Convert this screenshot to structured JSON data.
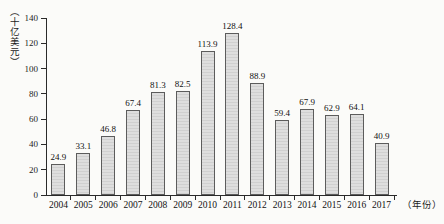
{
  "chart_data": {
    "type": "bar",
    "categories": [
      "2004",
      "2005",
      "2006",
      "2007",
      "2008",
      "2009",
      "2010",
      "2011",
      "2012",
      "2013",
      "2014",
      "2015",
      "2016",
      "2017"
    ],
    "values": [
      24.9,
      33.1,
      46.8,
      67.4,
      81.3,
      82.5,
      113.9,
      128.4,
      88.9,
      59.4,
      67.9,
      62.9,
      64.1,
      40.9
    ],
    "value_labels": [
      "24.9",
      "33.1",
      "46.8",
      "67.4",
      "81.3",
      "82.5",
      "113.9",
      "128.4",
      "88.9",
      "59.4",
      "67.9",
      "62.9",
      "64.1",
      "40.9"
    ],
    "title": "",
    "xlabel": "（年份）",
    "ylabel": "（十亿美元）",
    "ylim": [
      0,
      140
    ],
    "yticks": [
      0,
      20,
      40,
      60,
      80,
      100,
      120,
      140
    ],
    "ytick_labels": [
      "0",
      "20",
      "40",
      "60",
      "80",
      "100",
      "120",
      "140"
    ],
    "grid": false,
    "legend": false,
    "bar_fill_color": "#d8d8d8",
    "bar_border_color": "#5c5c5c",
    "axis_color": "#2a2a2a",
    "background_color": "#fbfbf9"
  }
}
